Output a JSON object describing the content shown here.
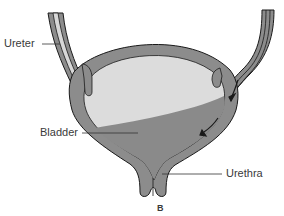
{
  "diagram": {
    "caption": "B",
    "labels": {
      "ureter": "Ureter",
      "bladder": "Bladder",
      "urethra": "Urethra"
    },
    "colors": {
      "wall": "#8c8c8c",
      "outline": "#1a1a1a",
      "bladder_interior": "#dcdcdc",
      "urine": "#8a8a8a",
      "ureter_lumen": "#d8d8d8",
      "label_text": "#3a3a3a"
    }
  }
}
